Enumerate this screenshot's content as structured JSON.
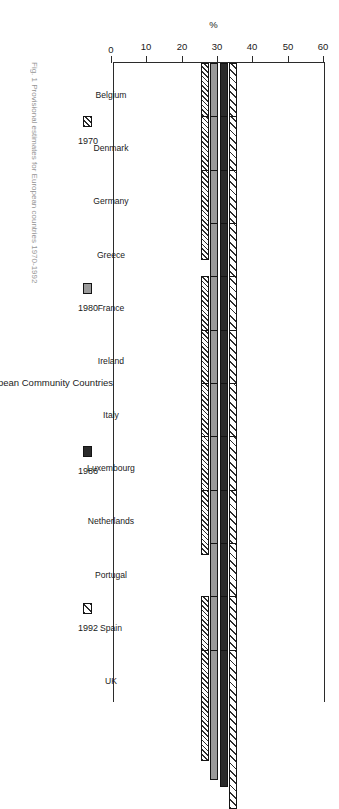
{
  "figure": {
    "caption": "Fig. 1  Provisional estimates for European countries 1970-1992"
  },
  "chart_data": {
    "type": "bar",
    "orientation": "vertical-rotated",
    "title": "",
    "xlabel": "European Community Countries",
    "ylabel": "%",
    "ylim": [
      0,
      60
    ],
    "yticks": [
      0,
      10,
      20,
      30,
      40,
      50,
      60
    ],
    "grid": false,
    "legend_position": "below-axis",
    "categories": [
      "Belgium",
      "Denmark",
      "Germany",
      "Greece",
      "France",
      "Ireland",
      "Italy",
      "Luxembourg",
      "Netherlands",
      "Portugal",
      "Spain",
      "UK"
    ],
    "series": [
      {
        "name": "1970",
        "color": "#ffffff",
        "pattern": "hatch-fine",
        "values": [
          24.5,
          36.0,
          25.5,
          null,
          29.0,
          23.0,
          21.5,
          20.5,
          18.5,
          null,
          18.0,
          31.5
        ]
      },
      {
        "name": "1980",
        "color": "#9a9a9a",
        "pattern": "solid-gray",
        "values": [
          28.5,
          44.0,
          31.0,
          21.0,
          34.5,
          26.0,
          25.5,
          26.0,
          23.5,
          34.5,
          21.0,
          37.0
        ]
      },
      {
        "name": "1986",
        "color": "#2b2b2b",
        "pattern": "solid-black",
        "values": [
          30.5,
          51.0,
          33.5,
          27.5,
          36.0,
          28.0,
          27.0,
          30.0,
          28.0,
          35.5,
          21.5,
          39.0
        ]
      },
      {
        "name": "1992",
        "color": "#ffffff",
        "pattern": "hatch-coarse",
        "values": [
          40.0,
          46.0,
          41.5,
          35.0,
          45.0,
          34.5,
          35.0,
          37.0,
          40.0,
          45.0,
          32.5,
          45.0
        ]
      }
    ]
  }
}
